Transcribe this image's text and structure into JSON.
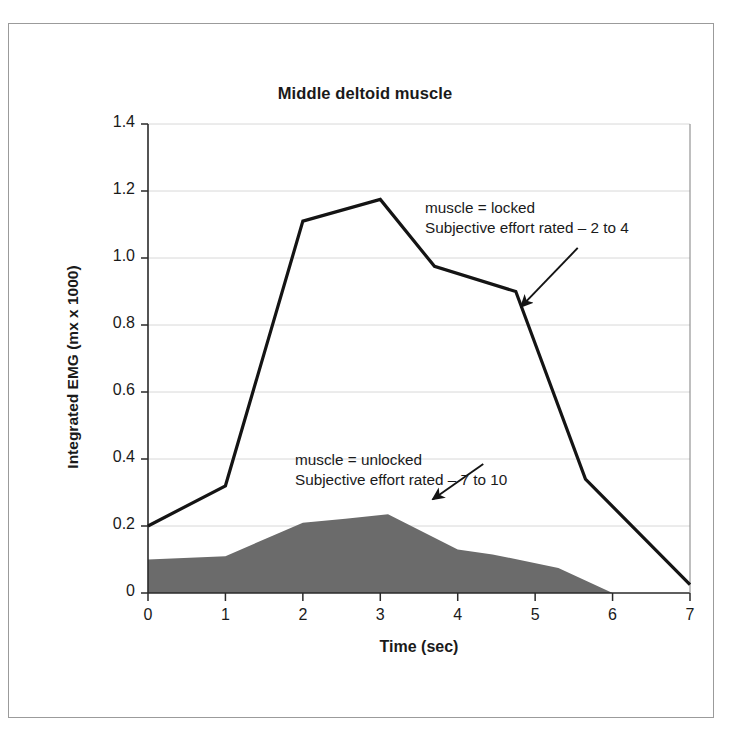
{
  "figure": {
    "title": "Middle deltoid muscle",
    "frame_color": "#9b9b9b",
    "background": "#ffffff"
  },
  "chart_data": {
    "type": "area",
    "title": "Middle deltoid muscle",
    "xlabel": "Time (sec)",
    "ylabel": "Integrated EMG (mx x 1000)",
    "xlim": [
      0,
      7
    ],
    "ylim": [
      0,
      1.4
    ],
    "grid": true,
    "grid_axis": "y",
    "legend": "none",
    "x_ticks": [
      0,
      1,
      2,
      3,
      4,
      5,
      6,
      7
    ],
    "x_tick_labels": [
      "0",
      "1",
      "2",
      "3",
      "4",
      "5",
      "6",
      "7"
    ],
    "y_ticks": [
      0,
      0.2,
      0.4,
      0.6,
      0.8,
      1.0,
      1.2,
      1.4
    ],
    "y_tick_labels": [
      "0",
      "0.2",
      "0.4",
      "0.6",
      "0.8",
      "1.0",
      "1.2",
      "1.4"
    ],
    "series": [
      {
        "name": "muscle = locked",
        "render": "line",
        "color": "#141414",
        "line_width": 3.2,
        "x": [
          0,
          1,
          2,
          3,
          3.7,
          4.75,
          5.65,
          7
        ],
        "values": [
          0.2,
          0.32,
          1.11,
          1.175,
          0.975,
          0.9,
          0.34,
          0.025
        ]
      },
      {
        "name": "muscle = unlocked",
        "render": "filled-area",
        "color": "#6b6b6b",
        "x": [
          0,
          1,
          2,
          2.55,
          3.1,
          4.0,
          4.45,
          5.3,
          6.0,
          7.0
        ],
        "values": [
          0.1,
          0.11,
          0.21,
          0.222,
          0.235,
          0.13,
          0.115,
          0.075,
          0.0,
          0.0
        ]
      }
    ],
    "annotations": [
      {
        "id": "locked",
        "lines": [
          "muscle = locked",
          "Subjective effort rated – 2 to 4"
        ],
        "arrow_from": [
          5.55,
          1.03
        ],
        "arrow_to": [
          4.82,
          0.855
        ]
      },
      {
        "id": "unlocked",
        "lines": [
          "muscle = unlocked",
          "Subjective effort rated – 7 to 10"
        ],
        "arrow_from": [
          4.33,
          0.385
        ],
        "arrow_to": [
          3.68,
          0.28
        ]
      }
    ]
  }
}
